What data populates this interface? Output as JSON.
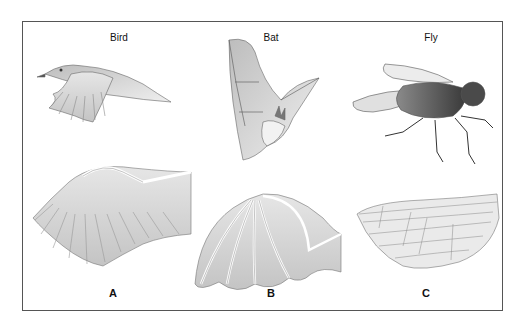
{
  "figure": {
    "columns": [
      {
        "title": "Bird",
        "letter": "A",
        "organism_illustration": "bird-in-flight",
        "wing_illustration": "bird-wing-skeleton-feathers"
      },
      {
        "title": "Bat",
        "letter": "B",
        "organism_illustration": "bat-in-flight",
        "wing_illustration": "bat-wing-skeleton-membrane"
      },
      {
        "title": "Fly",
        "letter": "C",
        "organism_illustration": "housefly",
        "wing_illustration": "fly-wing-veins"
      }
    ],
    "colors": {
      "border": "#555555",
      "text": "#111111",
      "illustration_fill": "#d6d6d6",
      "illustration_stroke": "#666666",
      "bone": "#ffffff"
    }
  }
}
